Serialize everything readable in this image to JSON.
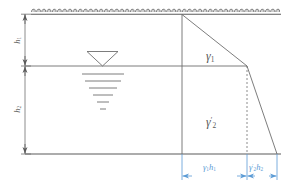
{
  "figure": {
    "type": "geotechnical-lateral-earth-pressure-diagram",
    "title_visible": false
  },
  "labels": {
    "h1": {
      "base": "h",
      "sub": "1",
      "text": "h₁"
    },
    "h2": {
      "base": "h",
      "sub": "2",
      "text": "h₂"
    },
    "gamma1": {
      "text": "γ",
      "sub": "1"
    },
    "gamma2prime": {
      "text": "γ",
      "sub": "2",
      "prime": "′"
    },
    "pressure_upper": {
      "text": "γ",
      "sub": "1",
      "factor": "h",
      "factor_sub": "1"
    },
    "pressure_lower": {
      "text": "γ",
      "sub": "2",
      "prime": "′",
      "factor": "h",
      "factor_sub": "2"
    }
  },
  "colors": {
    "line": "#5a5a5a",
    "thin_line": "#7a7a7a",
    "dimension_blue": "#5b9bd5",
    "label_gray": "#585858",
    "hatch": "#4f4f4f",
    "background": "#ffffff"
  },
  "geometry": {
    "ground_surface_y": 14,
    "water_table_y": 66,
    "base_y": 154,
    "wall_x": 182,
    "left_dim_x": 25,
    "break_point_x": 247,
    "base_right_x": 277,
    "apex_x": 182
  },
  "elements": {
    "ground_surface": "hatched ground line with repeating loop hatch pattern",
    "water_table_symbol": "inverted triangle with six tapering horizontal lines beneath",
    "dimension_h1": "vertical dimension from ground surface to water table",
    "dimension_h2": "vertical dimension from water table to base",
    "pressure_diagram": "trapezoidal pressure distribution with break at water table",
    "dashed_projection": "vertical dashed line at pressure break point",
    "dimension_upper": "horizontal dimension for gamma1*h1",
    "dimension_lower": "horizontal dimension for gamma2'*h2"
  }
}
